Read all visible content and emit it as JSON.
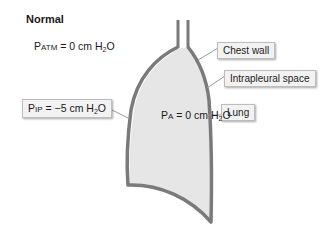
{
  "diagram": {
    "title": "Normal",
    "atmospheric_pressure": {
      "prefix": "P",
      "subscript_label": "ATM",
      "value": " = 0 cm H",
      "sub": "2",
      "suffix": "O"
    },
    "intrapleural_pressure": {
      "prefix": "P",
      "subscript_label": "IP",
      "value": " = −5 cm H",
      "sub": "2",
      "suffix": "O"
    },
    "alveolar_pressure": {
      "prefix": "P",
      "subscript_label": "A",
      "value": " = 0 cm H",
      "sub": "2",
      "suffix": "O"
    },
    "labels": {
      "chest_wall": "Chest wall",
      "intrapleural_space": "Intrapleural space",
      "lung": "Lung"
    },
    "colors": {
      "wall": "#7a7a7a",
      "lung_fill": "#e6e6e6",
      "label_bg": "#f2f2f2"
    }
  }
}
